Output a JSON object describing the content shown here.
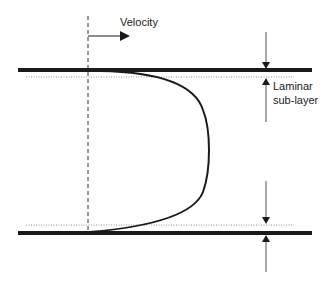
{
  "diagram": {
    "labels": {
      "velocity": "Velocity",
      "laminar_line1": "Laminar",
      "laminar_line2": "sub-layer"
    },
    "elements": {
      "top_wall": "pipe-wall-top",
      "bottom_wall": "pipe-wall-bottom",
      "velocity_profile": "turbulent velocity profile curve",
      "centerline": "dashed reference line",
      "sublayer_boundaries": "dotted laminar sub-layer lines"
    },
    "colors": {
      "stroke": "#1a1a1a",
      "dim": "#555555",
      "background": "#ffffff"
    }
  }
}
